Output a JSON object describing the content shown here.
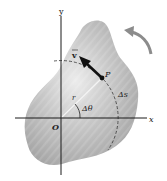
{
  "diagram": {
    "labels": {
      "y_axis": "y",
      "x_axis": "x",
      "origin": "O",
      "point": "P",
      "velocity": "v",
      "radius": "r",
      "angle": "Δθ",
      "arc_length": "Δs"
    },
    "colors": {
      "body_fill": "#b5b5b5",
      "body_highlight": "#e6e6e6",
      "axis": "#1a1a1a",
      "arrow": "#111111",
      "rotation_arrow": "#8a8a8a",
      "radius_line": "#f2f2f2"
    },
    "rotation_direction": "counterclockwise"
  }
}
